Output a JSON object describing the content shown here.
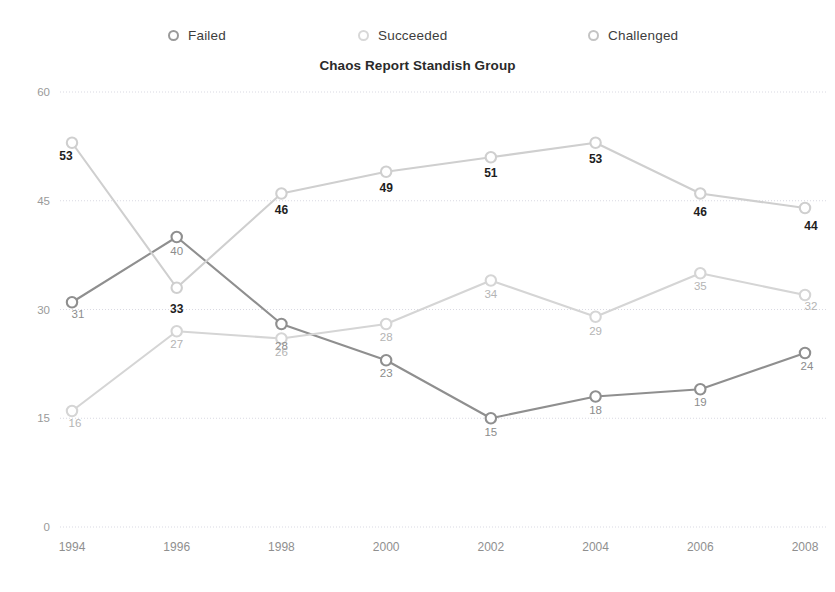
{
  "legend": {
    "items": [
      {
        "label": "Failed",
        "color": "#9a9a9a",
        "marker": "circle-marker-failed"
      },
      {
        "label": "Succeeded",
        "color": "#d8d8d8",
        "marker": "circle-marker-succeeded"
      },
      {
        "label": "Challenged",
        "color": "#c4c4c4",
        "marker": "circle-marker-challenged"
      }
    ]
  },
  "title": "Chaos Report Standish Group",
  "axes": {
    "y_ticks": [
      "0",
      "15",
      "30",
      "45",
      "60"
    ],
    "x_ticks": [
      "1994",
      "1996",
      "1998",
      "2000",
      "2002",
      "2004",
      "2006",
      "2008"
    ]
  },
  "chart_data": {
    "type": "line",
    "title": "Chaos Report Standish Group",
    "xlabel": "",
    "ylabel": "",
    "ylim": [
      0,
      60
    ],
    "yticks": [
      0,
      15,
      30,
      45,
      60
    ],
    "grid": true,
    "legend_position": "top",
    "categories": [
      "1994",
      "1996",
      "1998",
      "2000",
      "2002",
      "2004",
      "2006",
      "2008"
    ],
    "series": [
      {
        "name": "Failed",
        "color": "#8f8f8f",
        "label_style": "mid",
        "values": [
          31,
          40,
          28,
          23,
          15,
          18,
          19,
          24
        ],
        "labels": [
          "31",
          "40",
          "28",
          "23",
          "15",
          "18",
          "19",
          "24"
        ]
      },
      {
        "name": "Succeeded",
        "color": "#d5d5d5",
        "label_style": "light",
        "values": [
          16,
          27,
          26,
          28,
          34,
          29,
          35,
          32
        ],
        "labels": [
          "16",
          "27",
          "26",
          "28",
          "34",
          "29",
          "35",
          "32"
        ]
      },
      {
        "name": "Challenged",
        "color": "#cfcfcf",
        "label_style": "bold",
        "values": [
          53,
          33,
          46,
          49,
          51,
          53,
          46,
          44
        ],
        "labels": [
          "53",
          "33",
          "46",
          "49",
          "51",
          "53",
          "46",
          "44"
        ]
      }
    ]
  },
  "label_offsets": {
    "Failed": [
      [
        6,
        16
      ],
      [
        0,
        18
      ],
      [
        0,
        26
      ],
      [
        0,
        17
      ],
      [
        0,
        18
      ],
      [
        0,
        17
      ],
      [
        0,
        17
      ],
      [
        2,
        17
      ]
    ],
    "Succeeded": [
      [
        3,
        16
      ],
      [
        0,
        17
      ],
      [
        0,
        17
      ],
      [
        0,
        17
      ],
      [
        0,
        17
      ],
      [
        0,
        18
      ],
      [
        0,
        17
      ],
      [
        6,
        15
      ]
    ],
    "Challenged": [
      [
        -6,
        17
      ],
      [
        0,
        25
      ],
      [
        0,
        20
      ],
      [
        0,
        20
      ],
      [
        0,
        20
      ],
      [
        0,
        20
      ],
      [
        0,
        22
      ],
      [
        6,
        22
      ]
    ]
  }
}
